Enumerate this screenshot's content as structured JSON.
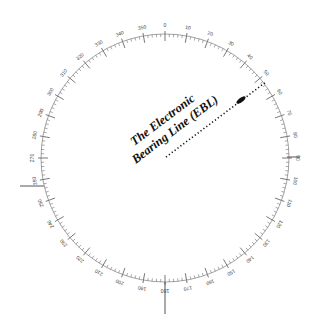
{
  "diagram": {
    "ebl_label_line1": "The Electronic",
    "ebl_label_line2": "Bearing Line (EBL)",
    "ring": {
      "center": [
        165,
        158
      ],
      "radius": 124,
      "label_step_deg": 10,
      "labels": [
        "0",
        "10",
        "20",
        "30",
        "40",
        "50",
        "60",
        "70",
        "80",
        "90",
        "100",
        "110",
        "120",
        "130",
        "140",
        "150",
        "160",
        "170",
        "180",
        "190",
        "200",
        "210",
        "220",
        "230",
        "240",
        "250",
        "260",
        "270",
        "280",
        "290",
        "300",
        "310",
        "320",
        "330",
        "340",
        "350"
      ]
    },
    "ebl": {
      "bearing_deg": 53,
      "color": "#111111"
    },
    "colors": {
      "ring": "#555555",
      "text": "#111111"
    }
  }
}
